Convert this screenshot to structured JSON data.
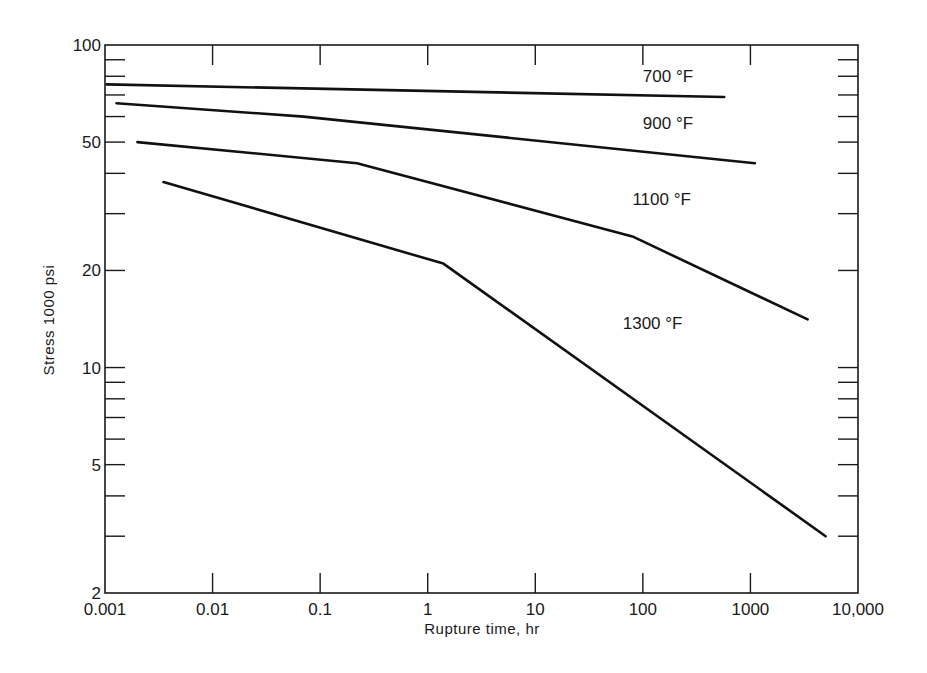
{
  "chart_data": {
    "type": "line",
    "title": "",
    "xlabel": "Rupture time, hr",
    "ylabel": "Stress 1000 psi",
    "xscale": "log",
    "yscale": "log",
    "xlim": [
      0.001,
      10000
    ],
    "ylim": [
      2,
      100
    ],
    "grid": false,
    "legend": "inline labels",
    "x_ticks": [
      {
        "value": 0.001,
        "label": "0.001"
      },
      {
        "value": 0.01,
        "label": "0.01"
      },
      {
        "value": 0.1,
        "label": "0.1"
      },
      {
        "value": 1,
        "label": "1"
      },
      {
        "value": 10,
        "label": "10"
      },
      {
        "value": 100,
        "label": "100"
      },
      {
        "value": 1000,
        "label": "1000"
      },
      {
        "value": 10000,
        "label": "10,000"
      }
    ],
    "y_ticks_labeled": [
      {
        "value": 100,
        "label": "100"
      },
      {
        "value": 50,
        "label": "50"
      },
      {
        "value": 20,
        "label": "20"
      },
      {
        "value": 10,
        "label": "10"
      },
      {
        "value": 5,
        "label": "5"
      },
      {
        "value": 2,
        "label": "2"
      }
    ],
    "y_ticks_minor": [
      90,
      80,
      70,
      60,
      40,
      30,
      9,
      8,
      7,
      6,
      4,
      3
    ],
    "series": [
      {
        "name": "700 °F",
        "points": [
          [
            0.00104,
            75.5
          ],
          [
            570,
            69
          ]
        ],
        "label_pos": [
          100,
          77
        ]
      },
      {
        "name": "900 °F",
        "points": [
          [
            0.00128,
            66
          ],
          [
            0.07,
            60
          ],
          [
            1100,
            43
          ]
        ],
        "label_pos": [
          100,
          55
        ]
      },
      {
        "name": "1100 °F",
        "points": [
          [
            0.002,
            50
          ],
          [
            0.22,
            43
          ],
          [
            80,
            25.5
          ],
          [
            3400,
            14.1
          ]
        ],
        "label_pos": [
          80,
          32
        ]
      },
      {
        "name": "1300 °F",
        "points": [
          [
            0.0035,
            37.6
          ],
          [
            1.4,
            21
          ],
          [
            5000,
            3.0
          ]
        ],
        "label_pos": [
          65,
          13.2
        ]
      }
    ]
  }
}
